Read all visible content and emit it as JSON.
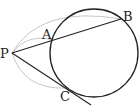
{
  "diagram": {
    "type": "geometry",
    "labels": {
      "P": "P",
      "A": "A",
      "B": "B",
      "C": "C"
    },
    "colors": {
      "line": "#222222",
      "arc": "#b0b0b0"
    }
  }
}
